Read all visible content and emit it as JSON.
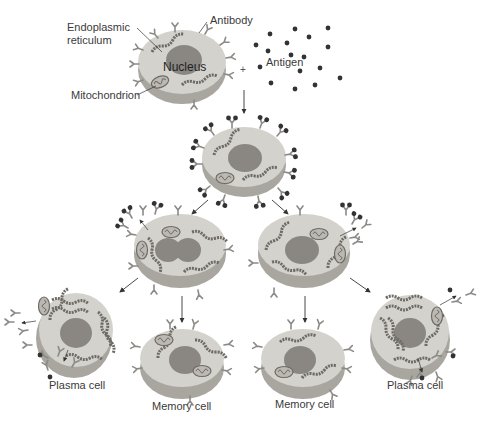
{
  "labels": {
    "endoplasmic_reticulum": "Endoplasmic\nreticulum",
    "endoplasmic_line1": "Endoplasmic",
    "endoplasmic_line2": "reticulum",
    "antibody": "Antibody",
    "nucleus": "Nucleus",
    "mitochondrion": "Mitochondrion",
    "antigen": "Antigen",
    "plus": "+",
    "plasma_cell_left": "Plasma cell",
    "plasma_cell_right": "Plasma cell",
    "memory_cell_left": "Memory cell",
    "memory_cell_right": "Memory cell"
  },
  "colors": {
    "background": "#ffffff",
    "cell_top": "#d4d2cc",
    "cell_side": "#a9a6a0",
    "nucleus": "#8a8782",
    "organelle": "#6e6b66",
    "antigen": "#333333",
    "antibody": "#8c8a86",
    "arrow": "#333333",
    "text": "#3a3a3a"
  }
}
